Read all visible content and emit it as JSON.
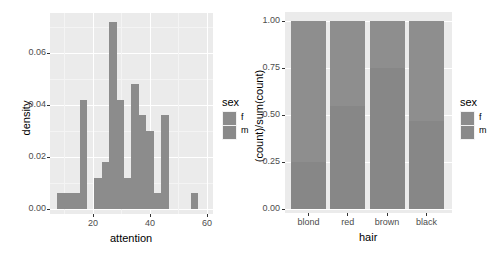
{
  "colors": {
    "panel_bg": "#ebebeb",
    "grid": "#ffffff",
    "f": "#8c8c8c",
    "m": "#8a8a8a"
  },
  "chart_data": [
    {
      "type": "bar",
      "subtype": "histogram (stacked by sex)",
      "title": "",
      "xlabel": "attention",
      "ylabel": "density",
      "xlim": [
        5,
        62
      ],
      "ylim": [
        0,
        0.075
      ],
      "x_ticks": [
        "20",
        "40",
        "60"
      ],
      "y_ticks": [
        "0.00",
        "0.02",
        "0.04",
        "0.06"
      ],
      "grid": true,
      "legend": {
        "title": "sex",
        "entries": [
          "f",
          "m"
        ],
        "position": "right"
      },
      "bins": [
        {
          "x0": 7.5,
          "x1": 10.1,
          "density": 0.006
        },
        {
          "x0": 10.1,
          "x1": 12.7,
          "density": 0.006
        },
        {
          "x0": 12.7,
          "x1": 15.3,
          "density": 0.006
        },
        {
          "x0": 15.3,
          "x1": 17.9,
          "density": 0.042
        },
        {
          "x0": 17.9,
          "x1": 20.5,
          "density": 0.0
        },
        {
          "x0": 20.5,
          "x1": 23.1,
          "density": 0.012
        },
        {
          "x0": 23.1,
          "x1": 25.7,
          "density": 0.018
        },
        {
          "x0": 25.7,
          "x1": 28.3,
          "density": 0.072
        },
        {
          "x0": 28.3,
          "x1": 30.9,
          "density": 0.042
        },
        {
          "x0": 30.9,
          "x1": 33.5,
          "density": 0.012
        },
        {
          "x0": 33.5,
          "x1": 36.1,
          "density": 0.048
        },
        {
          "x0": 36.1,
          "x1": 38.7,
          "density": 0.036
        },
        {
          "x0": 38.7,
          "x1": 41.3,
          "density": 0.03
        },
        {
          "x0": 41.3,
          "x1": 43.9,
          "density": 0.006
        },
        {
          "x0": 43.9,
          "x1": 46.5,
          "density": 0.036
        },
        {
          "x0": 46.5,
          "x1": 49.1,
          "density": 0.0
        },
        {
          "x0": 49.1,
          "x1": 51.7,
          "density": 0.0
        },
        {
          "x0": 51.7,
          "x1": 54.3,
          "density": 0.0
        },
        {
          "x0": 54.3,
          "x1": 56.9,
          "density": 0.006
        }
      ]
    },
    {
      "type": "bar",
      "subtype": "stacked proportion",
      "title": "",
      "xlabel": "hair",
      "ylabel": "(count)/sum(count)",
      "ylim": [
        0,
        1
      ],
      "categories": [
        "blond",
        "red",
        "brown",
        "black"
      ],
      "y_ticks": [
        "0.00",
        "0.25",
        "0.50",
        "0.75",
        "1.00"
      ],
      "grid": true,
      "legend": {
        "title": "sex",
        "entries": [
          "f",
          "m"
        ],
        "position": "right"
      },
      "series": [
        {
          "name": "m",
          "values": [
            0.25,
            0.55,
            0.75,
            0.47
          ]
        },
        {
          "name": "f",
          "values": [
            0.75,
            0.45,
            0.25,
            0.53
          ]
        }
      ]
    }
  ],
  "left": {
    "xlabel": "attention",
    "ylabel": "density",
    "x_ticks": [
      {
        "label": "20",
        "px": 93
      },
      {
        "label": "40",
        "px": 150
      },
      {
        "label": "60",
        "px": 207
      }
    ],
    "y_ticks": [
      {
        "label": "0.00",
        "px": 209
      },
      {
        "label": "0.02",
        "px": 157
      },
      {
        "label": "0.04",
        "px": 105
      },
      {
        "label": "0.06",
        "px": 53
      }
    ],
    "legend": {
      "title": "sex",
      "f": "f",
      "m": "m"
    }
  },
  "right": {
    "xlabel": "hair",
    "ylabel": "(count)/sum(count)",
    "categories": [
      "blond",
      "red",
      "brown",
      "black"
    ],
    "y_ticks": [
      "0.00",
      "0.25",
      "0.50",
      "0.75",
      "1.00"
    ],
    "legend": {
      "title": "sex",
      "f": "f",
      "m": "m"
    }
  }
}
